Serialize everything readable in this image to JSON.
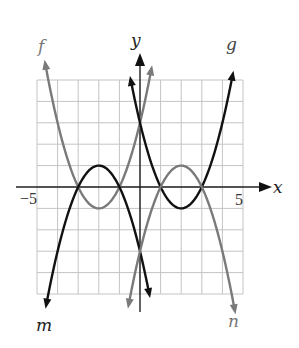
{
  "chart_data": {
    "type": "line",
    "title": "",
    "xlabel": "x",
    "ylabel": "y",
    "xlim": [
      -5,
      5
    ],
    "ylim": [
      -5,
      5
    ],
    "grid": true,
    "x_tick_labels": [
      {
        "value": -5,
        "label": "−5"
      },
      {
        "value": 5,
        "label": "5"
      }
    ],
    "series": [
      {
        "name": "f",
        "equation": "y = (x + 2)^2 - 1",
        "color": "#7a7a7a",
        "vertex": [
          -2,
          -1
        ],
        "x_intercepts": [
          -3,
          -1
        ],
        "y_intercept": 3,
        "x_range": [
          -4.6,
          0.55
        ],
        "arrow_ends": "both"
      },
      {
        "name": "m",
        "equation": "y = -(x + 2)^2 + 1",
        "color": "#111111",
        "vertex": [
          -2,
          1
        ],
        "x_intercepts": [
          -3,
          -1
        ],
        "y_intercept": -3,
        "x_range": [
          -4.55,
          0.45
        ],
        "arrow_ends": "both"
      },
      {
        "name": "g",
        "equation": "y = (x - 2)^2 - 1",
        "color": "#111111",
        "vertex": [
          2,
          -1
        ],
        "x_intercepts": [
          1,
          3
        ],
        "y_intercept": 3,
        "x_range": [
          -0.45,
          4.5
        ],
        "arrow_ends": "both"
      },
      {
        "name": "n",
        "equation": "y = -(x - 2)^2 + 1",
        "color": "#7a7a7a",
        "vertex": [
          2,
          1
        ],
        "x_intercepts": [
          1,
          3
        ],
        "y_intercept": -3,
        "x_range": [
          -0.55,
          4.6
        ],
        "arrow_ends": "both"
      }
    ],
    "curve_labels": [
      {
        "name": "f",
        "text": "f",
        "x_px": 42,
        "y_px": 52
      },
      {
        "name": "g",
        "text": "g",
        "x_px": 232,
        "y_px": 50
      },
      {
        "name": "m",
        "text": "m",
        "x_px": 44,
        "y_px": 331
      },
      {
        "name": "n",
        "text": "n",
        "x_px": 233,
        "y_px": 327
      }
    ]
  },
  "axes": {
    "x_label": "x",
    "y_label": "y",
    "x_min_label": "−5",
    "x_max_label": "5"
  }
}
